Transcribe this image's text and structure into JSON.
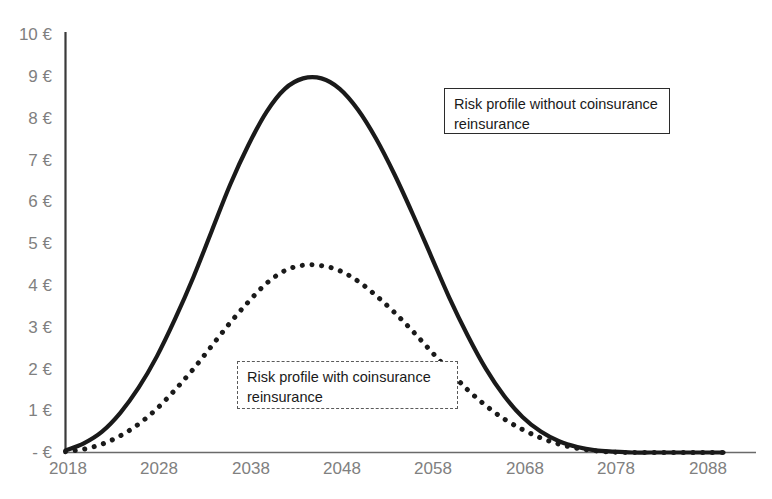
{
  "chart_data": {
    "type": "line",
    "title": "",
    "xlabel": "",
    "ylabel": "",
    "xlim": [
      2018,
      2090
    ],
    "ylim": [
      0,
      10
    ],
    "grid": false,
    "legend_position": "inline-annotations",
    "x_tick_labels": [
      "2018",
      "2028",
      "2038",
      "2048",
      "2058",
      "2068",
      "2078",
      "2088"
    ],
    "x_tick_values": [
      2018,
      2028,
      2038,
      2048,
      2058,
      2068,
      2078,
      2088
    ],
    "y_tick_labels": [
      "- €",
      "1 €",
      "2 €",
      "3 €",
      "4 €",
      "5 €",
      "6 €",
      "7 €",
      "8 €",
      "9 €",
      "10 €"
    ],
    "y_tick_values": [
      0,
      1,
      2,
      3,
      4,
      5,
      6,
      7,
      8,
      9,
      10
    ],
    "x": [
      2018,
      2020,
      2022,
      2024,
      2026,
      2028,
      2030,
      2032,
      2034,
      2036,
      2038,
      2040,
      2042,
      2044,
      2046,
      2048,
      2050,
      2052,
      2054,
      2056,
      2058,
      2060,
      2062,
      2064,
      2066,
      2068,
      2070,
      2072,
      2074,
      2076,
      2078,
      2080,
      2082,
      2084,
      2086,
      2088,
      2090
    ],
    "series": [
      {
        "name": "Risk profile without coinsurance reinsurance",
        "style": "solid",
        "color": "#1a1a1a",
        "line_width": 4.2,
        "values": [
          0.05,
          0.22,
          0.5,
          0.95,
          1.55,
          2.3,
          3.2,
          4.2,
          5.3,
          6.4,
          7.35,
          8.15,
          8.7,
          8.95,
          8.95,
          8.7,
          8.2,
          7.5,
          6.65,
          5.7,
          4.7,
          3.7,
          2.8,
          2.0,
          1.35,
          0.85,
          0.5,
          0.27,
          0.13,
          0.05,
          0.02,
          0.0,
          0.0,
          0.0,
          0.0,
          0.0,
          0.0
        ]
      },
      {
        "name": "Risk profile with coinsurance reinsurance",
        "style": "dotted",
        "color": "#1a1a1a",
        "line_width": 5.0,
        "values": [
          0.02,
          0.08,
          0.2,
          0.4,
          0.68,
          1.05,
          1.5,
          2.0,
          2.55,
          3.1,
          3.6,
          4.05,
          4.35,
          4.48,
          4.47,
          4.35,
          4.1,
          3.75,
          3.35,
          2.9,
          2.42,
          1.95,
          1.5,
          1.12,
          0.8,
          0.55,
          0.35,
          0.2,
          0.1,
          0.04,
          0.01,
          0.0,
          0.0,
          0.0,
          0.0,
          0.0,
          0.0
        ]
      }
    ],
    "annotations": [
      {
        "id": "without",
        "text_line_1": "Risk profile without coinsurance",
        "text_line_2": "reinsurance",
        "border_style": "solid"
      },
      {
        "id": "with",
        "text_line_1": "Risk profile with coinsurance",
        "text_line_2": "reinsurance",
        "border_style": "dashed"
      }
    ],
    "axis_color": "#3a3a3a",
    "tick_label_color": "#808080"
  }
}
